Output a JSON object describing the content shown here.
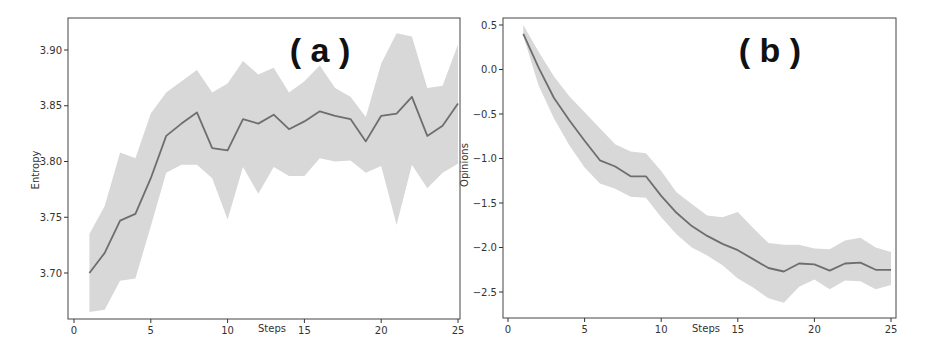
{
  "figure": {
    "colors": {
      "line": "#6e6e6e",
      "band": "#d8d8d8",
      "axis": "#333333",
      "background": "#ffffff"
    }
  },
  "chart_data": [
    {
      "type": "line",
      "panel_label": "( a )",
      "title": "",
      "xlabel": "Steps",
      "ylabel": "Entropy",
      "xlim": [
        0,
        25
      ],
      "ylim": [
        3.66,
        3.93
      ],
      "xticks": [
        0,
        5,
        10,
        15,
        20,
        25
      ],
      "xtick_labels": [
        "0",
        "5",
        "10",
        "15",
        "20",
        "25"
      ],
      "yticks": [
        3.7,
        3.75,
        3.8,
        3.85,
        3.9
      ],
      "ytick_labels": [
        "3.70",
        "3.75",
        "3.80",
        "3.85",
        "3.90"
      ],
      "grid": false,
      "legend": null,
      "x": [
        1,
        2,
        3,
        4,
        5,
        6,
        7,
        8,
        9,
        10,
        11,
        12,
        13,
        14,
        15,
        16,
        17,
        18,
        19,
        20,
        21,
        22,
        23,
        24,
        25
      ],
      "series": [
        {
          "name": "mean",
          "values": [
            3.7,
            3.718,
            3.747,
            3.753,
            3.785,
            3.823,
            3.834,
            3.844,
            3.812,
            3.81,
            3.838,
            3.834,
            3.842,
            3.829,
            3.836,
            3.845,
            3.841,
            3.838,
            3.818,
            3.841,
            3.843,
            3.858,
            3.823,
            3.832,
            3.852
          ]
        },
        {
          "name": "upper",
          "values": [
            3.735,
            3.76,
            3.808,
            3.803,
            3.843,
            3.862,
            3.872,
            3.882,
            3.862,
            3.87,
            3.89,
            3.878,
            3.884,
            3.862,
            3.872,
            3.886,
            3.866,
            3.858,
            3.84,
            3.888,
            3.915,
            3.912,
            3.866,
            3.868,
            3.905
          ]
        },
        {
          "name": "lower",
          "values": [
            3.665,
            3.667,
            3.693,
            3.695,
            3.742,
            3.79,
            3.797,
            3.797,
            3.785,
            3.748,
            3.795,
            3.771,
            3.795,
            3.787,
            3.787,
            3.803,
            3.8,
            3.801,
            3.79,
            3.796,
            3.743,
            3.797,
            3.776,
            3.79,
            3.798
          ]
        }
      ]
    },
    {
      "type": "line",
      "panel_label": "( b )",
      "title": "",
      "xlabel": "Steps",
      "ylabel": "Opinions",
      "xlim": [
        0,
        25
      ],
      "ylim": [
        -2.8,
        0.55
      ],
      "xticks": [
        0,
        5,
        10,
        15,
        20,
        25
      ],
      "xtick_labels": [
        "0",
        "5",
        "10",
        "15",
        "20",
        "25"
      ],
      "yticks": [
        0.5,
        0.0,
        -0.5,
        -1.0,
        -1.5,
        -2.0,
        -2.5
      ],
      "ytick_labels": [
        "0.5",
        "0.0",
        "−0.5",
        "−1.0",
        "−1.5",
        "−2.0",
        "−2.5"
      ],
      "grid": false,
      "legend": null,
      "x": [
        1,
        2,
        3,
        4,
        5,
        6,
        7,
        8,
        9,
        10,
        11,
        12,
        13,
        14,
        15,
        16,
        17,
        18,
        19,
        20,
        21,
        22,
        23,
        24,
        25
      ],
      "series": [
        {
          "name": "mean",
          "values": [
            0.4,
            0.02,
            -0.32,
            -0.57,
            -0.8,
            -1.02,
            -1.09,
            -1.2,
            -1.2,
            -1.42,
            -1.61,
            -1.76,
            -1.87,
            -1.96,
            -2.03,
            -2.13,
            -2.23,
            -2.27,
            -2.18,
            -2.19,
            -2.26,
            -2.18,
            -2.17,
            -2.25,
            -2.25
          ]
        },
        {
          "name": "upper",
          "values": [
            0.5,
            0.2,
            -0.08,
            -0.3,
            -0.48,
            -0.66,
            -0.84,
            -0.92,
            -0.94,
            -1.14,
            -1.38,
            -1.51,
            -1.64,
            -1.66,
            -1.6,
            -1.78,
            -1.95,
            -1.97,
            -1.97,
            -2.01,
            -2.02,
            -1.92,
            -1.89,
            -2.0,
            -2.05
          ]
        },
        {
          "name": "lower",
          "values": [
            0.38,
            -0.18,
            -0.55,
            -0.85,
            -1.1,
            -1.28,
            -1.34,
            -1.43,
            -1.44,
            -1.66,
            -1.85,
            -2.0,
            -2.09,
            -2.2,
            -2.35,
            -2.45,
            -2.57,
            -2.62,
            -2.44,
            -2.36,
            -2.47,
            -2.37,
            -2.38,
            -2.47,
            -2.42
          ]
        }
      ]
    }
  ]
}
